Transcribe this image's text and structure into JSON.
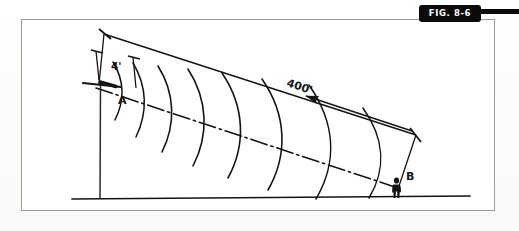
{
  "figure": {
    "banner_label": "FIG. 8-6",
    "banner_color": "#0b0b0b",
    "banner_text_color": "#ffffff",
    "frame_color": "#9a9a96",
    "ink_color": "#141414",
    "page_background": "#ffffff"
  },
  "diagram": {
    "type": "technical-line-drawing",
    "labels": {
      "point_a": "A",
      "point_b": "B",
      "short_dimension": "4'",
      "long_dimension": "400'"
    },
    "annotations": [
      {
        "name": "source-point-label",
        "text": "A"
      },
      {
        "name": "receiver-point-label",
        "text": "B"
      },
      {
        "name": "near-dimension-label",
        "text": "4'"
      },
      {
        "name": "overall-dimension-label",
        "text": "400'"
      }
    ],
    "elements": {
      "ground_line": "horizontal baseline",
      "mast": "vertical pole supporting point A",
      "centerline": "dash-dot axis from A to B",
      "wavefronts": "seven concentric arcs expanding from A toward B",
      "figure_person": "standing human silhouette at point B",
      "dimension_lines": "extension and arrow dimension lines for 4' and 400'"
    },
    "wavefront_count": 7
  }
}
